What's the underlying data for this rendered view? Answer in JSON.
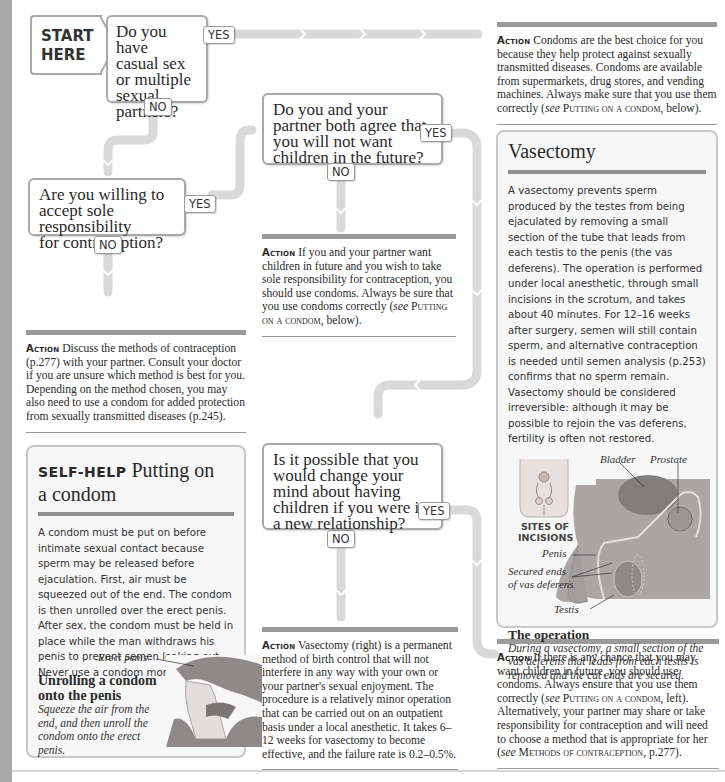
{
  "page": {
    "start_label_line1": "START",
    "start_label_line2": "HERE"
  },
  "questions": [
    {
      "id": "q1",
      "text": "Do you have casual sex or multiple sexual partners?",
      "lines": [
        "Do you have",
        "casual sex",
        "or multiple",
        "sexual",
        "partners?"
      ],
      "yes": "YES",
      "no": "NO"
    },
    {
      "id": "q2",
      "text": "Do you and your partner both agree that you will not want children in the future?",
      "lines": [
        "Do you and your",
        "partner both agree that",
        "you will not want",
        "children in the future?"
      ],
      "yes": "YES",
      "no": "NO"
    },
    {
      "id": "q3",
      "text": "Are you willing to accept sole responsibility for contraception?",
      "lines": [
        "Are you willing to",
        "accept sole responsibility",
        "for contraception?"
      ],
      "yes": "YES",
      "no": "NO"
    },
    {
      "id": "q4",
      "text": "Is it possible that you would change your mind about having children if you were in a new relationship?",
      "lines": [
        "Is it possible that you",
        "would change your",
        "mind about having",
        "children if you were in",
        "a new relationship?"
      ],
      "yes": "YES",
      "no": "NO"
    }
  ],
  "actions": {
    "lead": "Action",
    "condoms_best": {
      "text1": "Condoms are the best choice for you because they help protect against sexually transmitted diseases. Condoms are available from supermarkets, drug stores, and vending machines. Always make sure that you use them correctly (",
      "see": "see",
      "ref": "Putting on a condom",
      "text2": ", below)."
    },
    "sole_responsibility": {
      "text1": "If you and your partner want children in future and you wish to take sole responsibility for contraception, you should use condoms. Always be sure that you use condoms correctly (",
      "see": "see",
      "ref": "Putting on a condom",
      "text2": ", below)."
    },
    "discuss_methods": {
      "text": "Discuss the methods of contraception (p.277) with your partner. Consult your doctor if you are unsure which method is best for you. Depending on the method chosen, you may also need to use a condom for added protection from sexually transmitted diseases (p.245)."
    },
    "vasectomy": {
      "text": "Vasectomy (right) is a permanent method of birth control that will not interfere in any way with your own or your partner's sexual enjoyment. The procedure is a relatively minor operation that can be carried out on an outpatient basis under a local anesthetic. It takes 6–12 weeks for vasectomy to become effective, and the failure rate is 0.2–0.5%."
    },
    "may_want_children": {
      "text1": "If there is any chance that you may want children in future, you should use condoms. Always ensure that you use them correctly (",
      "see1": "see",
      "ref1": "Putting on a condom",
      "text2": ", left). Alternatively, your partner may share or take responsibility for contraception and will need to choose a method that is appropriate for her (",
      "see2": "see",
      "ref2": "Methods of contraception",
      "text3": ", p.277)."
    }
  },
  "vasectomy_panel": {
    "title": "Vasectomy",
    "body": "A vasectomy prevents sperm produced by the testes from being ejaculated by removing a small section of the tube that leads from each testis to the penis (the vas deferens). The operation is performed under local anesthetic, through small incisions in the scrotum, and takes about 40 minutes. For 12–16 weeks after surgery, semen will still contain sperm, and alternative contraception is needed until semen analysis (p.253) confirms that no sperm remain. Vasectomy should be considered irreversible: although it may be possible to rejoin the vas deferens, fertility is often not restored.",
    "labels": {
      "bladder": "Bladder",
      "prostate": "Prostate",
      "sites_line1": "SITES OF",
      "sites_line2": "INCISIONS",
      "penis": "Penis",
      "secured_line1": "Secured ends",
      "secured_line2": "of vas deferens",
      "testis": "Testis"
    },
    "caption_title": "The operation",
    "caption_text": "During a vasectomy, a small section of the vas deferens that leads from each testis is removed and the cut ends are secured."
  },
  "selfhelp_panel": {
    "kicker": "SELF-HELP",
    "title_line1": "Putting on",
    "title_line2": "a condom",
    "body": "A condom must be put on before intimate sexual contact because sperm may be released before ejaculation. First, air must be squeezed out of the end. The condom is then unrolled over the erect penis. After sex, the condom must be held in place while the man withdraws his penis to prevent semen leaking out. Never use a condom more than once.",
    "label_erect": "Erect penis",
    "caption_title_line1": "Unrolling a condom",
    "caption_title_line2": "onto the penis",
    "caption_text": "Squeeze the air from the end, and then unroll the condom onto the erect penis."
  },
  "colors": {
    "connector": "#d9d9d9",
    "box_border": "#a9a9a9",
    "rule": "#9a9a9a",
    "panel_bg": "#f7f7f7",
    "strip": "#a8a8a8"
  }
}
